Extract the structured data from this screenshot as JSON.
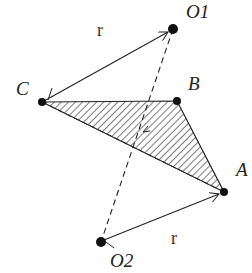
{
  "diagram": {
    "points": {
      "O1": {
        "label": "O1",
        "x": 173,
        "y": 29
      },
      "C": {
        "label": "C",
        "x": 42,
        "y": 102
      },
      "B": {
        "label": "B",
        "x": 177,
        "y": 101
      },
      "A": {
        "label": "A",
        "x": 224,
        "y": 192
      },
      "O2": {
        "label": "O2",
        "x": 101,
        "y": 242
      }
    },
    "vectors": [
      {
        "from": "C",
        "to": "O1",
        "label": "r"
      },
      {
        "from": "O2",
        "to": "A",
        "label": "r"
      }
    ],
    "dashed_lines": [
      {
        "from": "O1",
        "to": "O2"
      },
      {
        "from": "C",
        "to": "A"
      }
    ],
    "shaded_triangle": [
      "C",
      "B",
      "A"
    ],
    "labels": {
      "O1": "O1",
      "O2": "O2",
      "A": "A",
      "B": "B",
      "C": "C",
      "r_top": "r",
      "r_bottom": "r"
    },
    "colors": {
      "stroke": "#222222",
      "hatch": "#333333",
      "background": "#ffffff"
    }
  }
}
